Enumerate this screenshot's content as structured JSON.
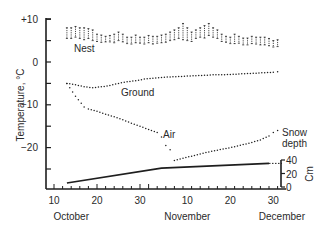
{
  "chart_data": {
    "type": "scatter",
    "title": "",
    "ylabel": "Temperature, °C",
    "xlabel": "",
    "ylim": [
      -28,
      10
    ],
    "yticks": [
      10,
      0,
      -10,
      -20
    ],
    "ytick_labels": [
      "+10",
      "0",
      "−10",
      "−20"
    ],
    "x_tick_labels": [
      "10",
      "20",
      "30",
      "10",
      "20",
      "30"
    ],
    "x_tick_days": [
      10,
      20,
      30,
      41,
      51,
      61
    ],
    "month_labels": [
      {
        "label": "October",
        "day": 14
      },
      {
        "label": "November",
        "day": 41
      },
      {
        "label": "December",
        "day": 63
      }
    ],
    "x_unit": "days since 1 October",
    "grid": false,
    "legend": "inline labels",
    "series": [
      {
        "name": "Nest",
        "style": "range-bars",
        "label_day": 14,
        "label_value": 3.5,
        "x": [
          13,
          14,
          15,
          16,
          17,
          18,
          19,
          20,
          21,
          22,
          23,
          24,
          25,
          26,
          27,
          28,
          29,
          30,
          31,
          32,
          33,
          34,
          35,
          36,
          37,
          38,
          39,
          40,
          41,
          42,
          43,
          44,
          45,
          46,
          47,
          48,
          49,
          50,
          51,
          52,
          53,
          54,
          55,
          56,
          57,
          58,
          59,
          60,
          61,
          62
        ],
        "low": [
          5.5,
          5.5,
          5.8,
          5.5,
          5.2,
          5.5,
          5.0,
          4.8,
          4.6,
          4.7,
          4.7,
          4.5,
          5.0,
          4.7,
          4.3,
          4.2,
          4.5,
          4.4,
          4.2,
          4.5,
          4.2,
          4.4,
          4.5,
          4.6,
          5.0,
          5.2,
          5.5,
          5.2,
          5.0,
          4.8,
          5.5,
          5.8,
          5.6,
          6.2,
          5.8,
          5.5,
          4.8,
          4.6,
          4.3,
          4.3,
          4.4,
          4.0,
          4.0,
          4.3,
          4.2,
          4.0,
          4.0,
          3.8,
          3.5,
          3.6
        ],
        "high": [
          8.0,
          8.0,
          8.3,
          8.0,
          8.0,
          7.8,
          7.5,
          6.5,
          6.3,
          6.0,
          6.2,
          6.5,
          7.0,
          6.5,
          5.8,
          5.8,
          6.3,
          5.8,
          5.8,
          6.2,
          6.0,
          6.0,
          6.3,
          6.5,
          7.0,
          7.5,
          8.0,
          9.0,
          8.0,
          7.0,
          7.5,
          8.0,
          8.5,
          9.0,
          8.0,
          7.5,
          6.5,
          6.0,
          5.8,
          6.5,
          6.0,
          5.6,
          5.6,
          6.0,
          5.8,
          5.8,
          5.8,
          5.5,
          5.0,
          5.2
        ]
      },
      {
        "name": "Ground",
        "style": "dotted",
        "label_day": 30,
        "label_value": -7,
        "x": [
          13,
          15,
          17,
          19,
          21,
          23,
          25,
          27,
          29,
          31,
          33,
          35,
          37,
          39,
          41,
          43,
          45,
          47,
          49,
          51,
          53,
          55,
          57,
          59,
          61,
          62
        ],
        "values": [
          -5.0,
          -5.3,
          -5.8,
          -6.0,
          -5.8,
          -5.5,
          -5.0,
          -4.6,
          -4.4,
          -4.0,
          -3.8,
          -3.6,
          -3.5,
          -3.4,
          -3.3,
          -3.2,
          -3.1,
          -3.0,
          -3.0,
          -2.9,
          -2.8,
          -2.7,
          -2.6,
          -2.5,
          -2.4,
          -2.3
        ]
      },
      {
        "name": "Air",
        "style": "dotted",
        "label_day": 40,
        "label_value": -17.5,
        "x": [
          13,
          15,
          17,
          18,
          20,
          22,
          24,
          26,
          28,
          30,
          32,
          34,
          35,
          36,
          37,
          38,
          40,
          42,
          44,
          46,
          48,
          50,
          52,
          54,
          56,
          58,
          60,
          61,
          62
        ],
        "values": [
          -5.0,
          -8.0,
          -10.5,
          -11.0,
          -11.5,
          -12.2,
          -12.8,
          -13.5,
          -14.3,
          -15.0,
          -15.8,
          -16.5,
          -17.5,
          -19.5,
          -20.5,
          -23.0,
          -22.5,
          -22.0,
          -21.5,
          -21.0,
          -20.6,
          -20.2,
          -19.8,
          -19.3,
          -18.8,
          -18.2,
          -17.3,
          -16.5,
          -16.0
        ]
      }
    ],
    "secondary_axis": {
      "name": "Snow depth",
      "label_line1": "Snow",
      "label_line2": "depth",
      "unit": "Cm",
      "ylim": [
        0,
        40
      ],
      "yticks": [
        0,
        20,
        40
      ],
      "ytick_labels": [
        "0",
        "20",
        "40"
      ],
      "series": {
        "name": "Snow depth",
        "style": "solid-line",
        "x": [
          13,
          35,
          60
        ],
        "values": [
          6,
          28,
          35
        ],
        "dashed_extension": {
          "x": [
            60,
            63
          ],
          "values": [
            35,
            35
          ]
        }
      }
    }
  }
}
